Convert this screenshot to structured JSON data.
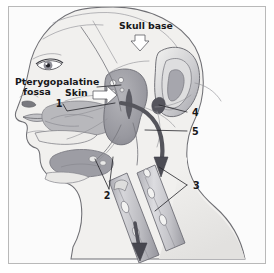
{
  "figure": {
    "background_color": "#fbfbfb",
    "frame_color": "#b9b9b9",
    "page_color": "#ffffff"
  },
  "labels": {
    "skull_base": "Skull base",
    "pterygopalatine_line1": "Pterygopalatine",
    "pterygopalatine_line2": "fossa",
    "skin": "Skin",
    "num_1": "1",
    "num_2": "2",
    "num_3": "3",
    "num_4": "4",
    "num_5": "5"
  },
  "colors": {
    "skin_fill": "#efeeec",
    "skin_outline": "#6f6f74",
    "tissue_mid": "#b6b6ba",
    "tissue_dark": "#8e8e95",
    "tissue_darkest": "#6e6e76",
    "graft_light": "#c9c9cd",
    "graft_shadow": "#9a9aa1",
    "arrow_dark": "#55555c",
    "label_text": "#17171a",
    "leader_line": "#25252a",
    "hollow_arrow_fill": "#ffffff"
  },
  "elements": {
    "head_profile": "lateral-head-profile",
    "ear": "external-ear",
    "eye": "eye",
    "nostril": "nostril",
    "lips": "lips",
    "pterygopalatine_mass": "pterygopalatine-fossa-mass",
    "maxillary_region": "maxillary-sinus-region",
    "submandibular_gland": "submandibular-gland",
    "nerve_graft_upper": "nerve-graft-tube-upper",
    "nerve_graft_lower": "nerve-graft-tube-lower",
    "transposition_arrow": "curved-transposition-arrow",
    "skin_arrow": "skin-hollow-arrow",
    "skull_base_arrow": "skull-base-hollow-arrow",
    "graft_direction_arrow": "graft-direction-arrow"
  }
}
